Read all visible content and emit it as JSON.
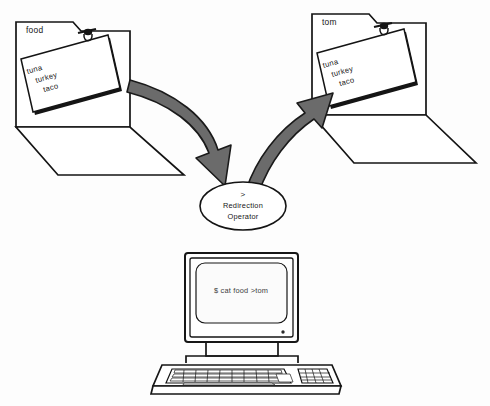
{
  "diagram": {
    "background_color": "#fdfdfd",
    "ink_color": "#141414",
    "arrow_fill_color": "#6b6b6b",
    "arrow_outline_color": "#1a1a1a"
  },
  "source_folder": {
    "tab_label": "food",
    "note_lines": [
      "tuna",
      "turkey",
      "taco"
    ],
    "clip_icon": "paper-clip-icon"
  },
  "destination_folder": {
    "tab_label": "tom",
    "note_lines": [
      "tuna",
      "turkey",
      "taco"
    ],
    "clip_icon": "paper-clip-icon"
  },
  "operator_node": {
    "symbol": ">",
    "line1": "Redirection",
    "line2": "Operator"
  },
  "arrows": [
    {
      "name": "arrow-source-to-operator",
      "from": "source_folder",
      "to": "operator_node",
      "direction": "down-right"
    },
    {
      "name": "arrow-operator-to-destination",
      "from": "operator_node",
      "to": "destination_folder",
      "direction": "up-right"
    }
  ],
  "computer": {
    "screen_text": "$ cat food >tom",
    "power_led": "power-led-indicator",
    "keyboard": {
      "main_rows": 5,
      "keypad_rows": 4,
      "keypad_cols": 4
    }
  }
}
